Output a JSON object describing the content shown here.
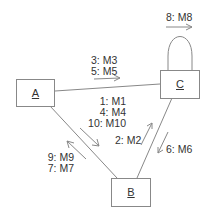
{
  "diagram": {
    "type": "communication-diagram",
    "objects": [
      {
        "id": "A",
        "label": "A"
      },
      {
        "id": "B",
        "label": "B"
      },
      {
        "id": "C",
        "label": "C"
      }
    ],
    "links": [
      {
        "from": "A",
        "to": "C"
      },
      {
        "from": "A",
        "to": "B"
      },
      {
        "from": "C",
        "to": "B"
      },
      {
        "from": "C",
        "to": "C",
        "self_loop": true
      }
    ],
    "messages": {
      "self_c": [
        "8: M8"
      ],
      "a_to_c": [
        "3: M3",
        "5: M5"
      ],
      "a_to_b": [
        "1: M1",
        "4: M4",
        "10: M10"
      ],
      "b_to_c": [
        "2: M2"
      ],
      "c_to_b": [
        "6: M6"
      ],
      "b_to_a": [
        "9: M9",
        "7: M7"
      ]
    }
  }
}
